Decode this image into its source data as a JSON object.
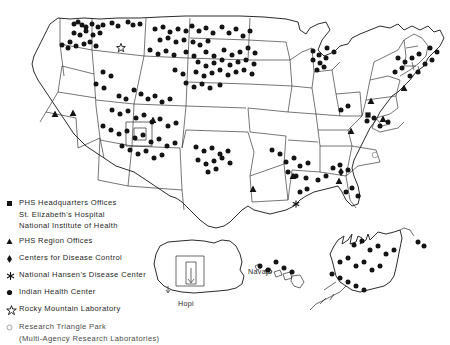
{
  "figure": {
    "name": "us-phs-facilities-map"
  },
  "map_labels": [
    {
      "id": "navajo",
      "text": "Navajo",
      "x": 248,
      "y": 272
    },
    {
      "id": "hopi",
      "text": "Hopi",
      "x": 196,
      "y": 303
    }
  ],
  "legend": {
    "items": [
      {
        "symbol": "square",
        "label": "PHS Headquarters Offices",
        "sublines": [
          "St. Elizabeth's Hospital",
          "National Institute of Health"
        ]
      },
      {
        "symbol": "triangle",
        "label": "PHS Region Offices",
        "sublines": []
      },
      {
        "symbol": "diamond",
        "label": "Centers for Disease Control",
        "sublines": []
      },
      {
        "symbol": "asterisk",
        "label": "National Hansen's Disease Center",
        "sublines": []
      },
      {
        "symbol": "dot",
        "label": "Indian Health Center",
        "sublines": []
      },
      {
        "symbol": "star",
        "label": "Rocky Mountain Laboratory",
        "sublines": []
      },
      {
        "symbol": "circle",
        "label": "Research Triangle Park",
        "sublines": [
          "(Multi-Agency Research Laboratories)"
        ]
      }
    ]
  },
  "chart_data": {
    "type": "map",
    "title": "",
    "projection": "us-outline-with-insets",
    "symbol_key": {
      "square": "PHS Headquarters Offices",
      "triangle": "PHS Region Offices",
      "diamond": "Centers for Disease Control",
      "asterisk": "National Hansen's Disease Center",
      "dot": "Indian Health Center",
      "star": "Rocky Mountain Laboratory",
      "circle": "Research Triangle Park (Multi-Agency Research Laboratories)"
    },
    "counts": {
      "dot": 128,
      "triangle": 10,
      "square": 1,
      "diamond": 1,
      "asterisk": 1,
      "star": 1,
      "circle": 1
    },
    "markers": {
      "square": [
        [
          368,
          115
        ]
      ],
      "diamond": [
        [
          341,
          172
        ]
      ],
      "asterisk": [
        [
          296,
          204
        ]
      ],
      "star": [
        [
          121,
          48
        ]
      ],
      "circle": [
        [
          375,
          155
        ]
      ],
      "triangle": [
        [
          55,
          114
        ],
        [
          73,
          113
        ],
        [
          153,
          120
        ],
        [
          253,
          189
        ],
        [
          293,
          176
        ],
        [
          339,
          181
        ],
        [
          351,
          131
        ],
        [
          371,
          101
        ],
        [
          383,
          119
        ],
        [
          404,
          88
        ]
      ],
      "dot": [
        [
          74,
          24
        ],
        [
          78,
          22
        ],
        [
          82,
          25
        ],
        [
          86,
          27
        ],
        [
          92,
          24
        ],
        [
          98,
          27
        ],
        [
          103,
          25
        ],
        [
          112,
          23
        ],
        [
          118,
          26
        ],
        [
          128,
          22
        ],
        [
          133,
          25
        ],
        [
          140,
          24
        ],
        [
          74,
          33
        ],
        [
          80,
          35
        ],
        [
          86,
          31
        ],
        [
          93,
          35
        ],
        [
          100,
          33
        ],
        [
          70,
          42
        ],
        [
          76,
          46
        ],
        [
          84,
          44
        ],
        [
          90,
          42
        ],
        [
          96,
          46
        ],
        [
          62,
          45
        ],
        [
          68,
          48
        ],
        [
          155,
          29
        ],
        [
          163,
          27
        ],
        [
          170,
          32
        ],
        [
          178,
          29
        ],
        [
          186,
          31
        ],
        [
          160,
          40
        ],
        [
          168,
          38
        ],
        [
          176,
          42
        ],
        [
          184,
          40
        ],
        [
          192,
          26
        ],
        [
          199,
          31
        ],
        [
          206,
          28
        ],
        [
          213,
          33
        ],
        [
          193,
          42
        ],
        [
          200,
          45
        ],
        [
          208,
          41
        ],
        [
          222,
          27
        ],
        [
          229,
          33
        ],
        [
          236,
          29
        ],
        [
          243,
          36
        ],
        [
          250,
          31
        ],
        [
          150,
          50
        ],
        [
          158,
          54
        ],
        [
          166,
          51
        ],
        [
          174,
          55
        ],
        [
          186,
          52
        ],
        [
          194,
          56
        ],
        [
          206,
          52
        ],
        [
          214,
          56
        ],
        [
          224,
          50
        ],
        [
          232,
          55
        ],
        [
          240,
          52
        ],
        [
          248,
          48
        ],
        [
          255,
          53
        ],
        [
          198,
          62
        ],
        [
          206,
          66
        ],
        [
          214,
          63
        ],
        [
          222,
          60
        ],
        [
          230,
          65
        ],
        [
          238,
          62
        ],
        [
          246,
          60
        ],
        [
          254,
          64
        ],
        [
          175,
          70
        ],
        [
          183,
          74
        ],
        [
          196,
          72
        ],
        [
          204,
          76
        ],
        [
          212,
          73
        ],
        [
          220,
          70
        ],
        [
          228,
          75
        ],
        [
          236,
          72
        ],
        [
          244,
          70
        ],
        [
          252,
          74
        ],
        [
          186,
          83
        ],
        [
          194,
          87
        ],
        [
          202,
          84
        ],
        [
          210,
          88
        ],
        [
          220,
          85
        ],
        [
          103,
          72
        ],
        [
          111,
          76
        ],
        [
          96,
          84
        ],
        [
          104,
          88
        ],
        [
          119,
          96
        ],
        [
          126,
          99
        ],
        [
          134,
          90
        ],
        [
          141,
          94
        ],
        [
          148,
          99
        ],
        [
          155,
          96
        ],
        [
          162,
          102
        ],
        [
          170,
          99
        ],
        [
          112,
          110
        ],
        [
          120,
          114
        ],
        [
          128,
          111
        ],
        [
          136,
          118
        ],
        [
          144,
          115
        ],
        [
          152,
          122
        ],
        [
          160,
          119
        ],
        [
          168,
          126
        ],
        [
          176,
          123
        ],
        [
          103,
          126
        ],
        [
          111,
          130
        ],
        [
          119,
          134
        ],
        [
          127,
          131
        ],
        [
          135,
          138
        ],
        [
          143,
          135
        ],
        [
          151,
          142
        ],
        [
          159,
          139
        ],
        [
          167,
          146
        ],
        [
          175,
          143
        ],
        [
          122,
          146
        ],
        [
          130,
          150
        ],
        [
          138,
          154
        ],
        [
          146,
          151
        ],
        [
          154,
          158
        ],
        [
          162,
          155
        ],
        [
          196,
          147
        ],
        [
          204,
          151
        ],
        [
          212,
          148
        ],
        [
          220,
          154
        ],
        [
          228,
          151
        ],
        [
          198,
          160
        ],
        [
          206,
          164
        ],
        [
          214,
          161
        ],
        [
          222,
          158
        ],
        [
          230,
          163
        ],
        [
          208,
          172
        ],
        [
          216,
          169
        ],
        [
          272,
          150
        ],
        [
          280,
          154
        ],
        [
          286,
          162
        ],
        [
          294,
          158
        ],
        [
          300,
          166
        ],
        [
          308,
          163
        ],
        [
          288,
          172
        ],
        [
          296,
          176
        ],
        [
          306,
          178
        ],
        [
          313,
          51
        ],
        [
          319,
          55
        ],
        [
          313,
          60
        ],
        [
          320,
          63
        ],
        [
          326,
          58
        ],
        [
          317,
          70
        ],
        [
          324,
          67
        ],
        [
          327,
          48
        ],
        [
          334,
          52
        ],
        [
          318,
          180
        ],
        [
          326,
          176
        ],
        [
          333,
          168
        ],
        [
          340,
          165
        ],
        [
          348,
          170
        ],
        [
          300,
          192
        ],
        [
          307,
          189
        ],
        [
          346,
          192
        ],
        [
          352,
          188
        ],
        [
          358,
          196
        ],
        [
          367,
          121
        ],
        [
          374,
          118
        ],
        [
          380,
          126
        ],
        [
          388,
          122
        ],
        [
          341,
          110
        ],
        [
          348,
          106
        ],
        [
          395,
          72
        ],
        [
          402,
          68
        ],
        [
          410,
          76
        ],
        [
          418,
          72
        ],
        [
          425,
          64
        ],
        [
          432,
          60
        ],
        [
          437,
          52
        ],
        [
          430,
          48
        ],
        [
          412,
          58
        ],
        [
          419,
          54
        ],
        [
          398,
          58
        ],
        [
          405,
          62
        ],
        [
          354,
          245
        ],
        [
          362,
          241
        ],
        [
          370,
          250
        ],
        [
          378,
          246
        ],
        [
          386,
          254
        ],
        [
          394,
          250
        ],
        [
          340,
          262
        ],
        [
          348,
          258
        ],
        [
          356,
          266
        ],
        [
          364,
          262
        ],
        [
          372,
          270
        ],
        [
          380,
          266
        ],
        [
          332,
          274
        ],
        [
          340,
          278
        ],
        [
          348,
          282
        ],
        [
          356,
          286
        ],
        [
          364,
          290
        ],
        [
          260,
          266
        ],
        [
          268,
          270
        ],
        [
          276,
          262
        ],
        [
          284,
          268
        ],
        [
          292,
          272
        ],
        [
          418,
          242
        ],
        [
          424,
          246
        ]
      ]
    }
  }
}
